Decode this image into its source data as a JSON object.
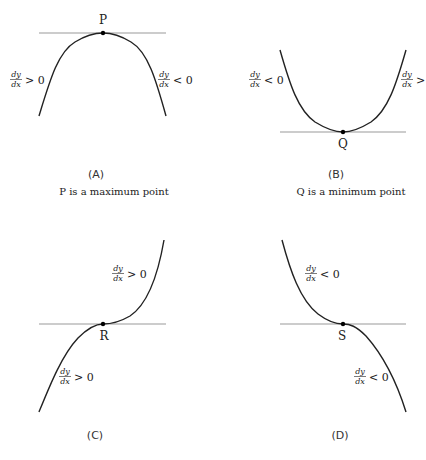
{
  "panels": [
    {
      "id": "A",
      "label": "(A)",
      "caption": "P is a maximum point",
      "point_label": "P",
      "left_grad": {
        "num": "dy",
        "den": "dx",
        "rel": "> 0"
      },
      "right_grad": {
        "num": "dy",
        "den": "dx",
        "rel": "< 0"
      },
      "type": "maximum"
    },
    {
      "id": "B",
      "label": "(B)",
      "caption": "Q is a minimum point",
      "point_label": "Q",
      "left_grad": {
        "num": "dy",
        "den": "dx",
        "rel": "< 0"
      },
      "right_grad": {
        "num": "dy",
        "den": "dx",
        "rel": ">"
      },
      "type": "minimum"
    },
    {
      "id": "C",
      "label": "(C)",
      "point_label": "R",
      "upper_grad": {
        "num": "dy",
        "den": "dx",
        "rel": "> 0"
      },
      "lower_grad": {
        "num": "dy",
        "den": "dx",
        "rel": "> 0"
      },
      "type": "rising-inflection"
    },
    {
      "id": "D",
      "label": "(D)",
      "point_label": "S",
      "upper_grad": {
        "num": "dy",
        "den": "dx",
        "rel": "< 0"
      },
      "lower_grad": {
        "num": "dy",
        "den": "dx",
        "rel": "< 0"
      },
      "type": "falling-inflection"
    }
  ],
  "colors": {
    "curve": "#222222",
    "tangent": "#888888",
    "text": "#222222"
  }
}
